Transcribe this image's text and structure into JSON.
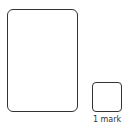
{
  "answer_area": {
    "working_box": "",
    "answer_box": "",
    "marks_label": "1 mark"
  }
}
